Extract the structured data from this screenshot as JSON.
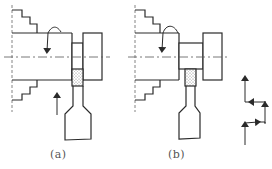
{
  "figure": {
    "panels": [
      {
        "id": "a",
        "caption": "(a)",
        "tool_feed": "radial plunge (arrow upward)",
        "rotation_indicator": "curved arrow on workpiece"
      },
      {
        "id": "b",
        "caption": "(b)",
        "tool_feed": "stepped feed path shown at right",
        "rotation_indicator": "curved arrow on workpiece"
      }
    ],
    "feed_path_sketch": {
      "description": "Zig-zag path of arrows: up, right, up, left, up"
    },
    "colors": {
      "line": "#2a2a2a",
      "background": "#ffffff",
      "caption": "#555555"
    }
  }
}
